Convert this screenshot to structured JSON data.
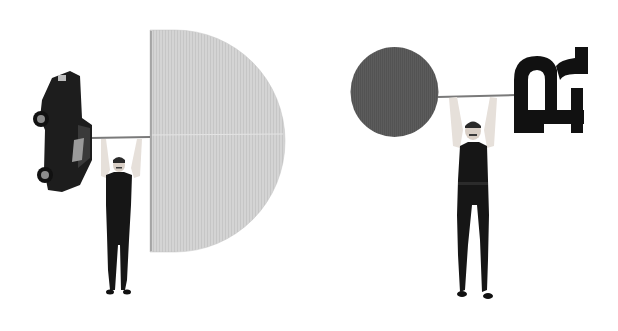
{
  "image": {
    "width": 618,
    "height": 331,
    "background": "#ffffff",
    "description": "Two collage illustrations of strongmen lifting barbells with unusual weights",
    "scenes": [
      {
        "name": "left-scene",
        "left_weight": "upside-down black car",
        "right_weight": "light gray half-disc (letter D shape)",
        "colors": {
          "disc": "#d3d3d3",
          "car": "#1c1c1c",
          "man": "#141414",
          "skin": "#e8e2dc"
        }
      },
      {
        "name": "right-scene",
        "left_weight": "dark gray circle",
        "right_weight": "black rotated letter R shape",
        "colors": {
          "circle": "#5b5b5b",
          "letter": "#111111",
          "man": "#141414",
          "skin": "#e8e2dc"
        }
      }
    ]
  }
}
